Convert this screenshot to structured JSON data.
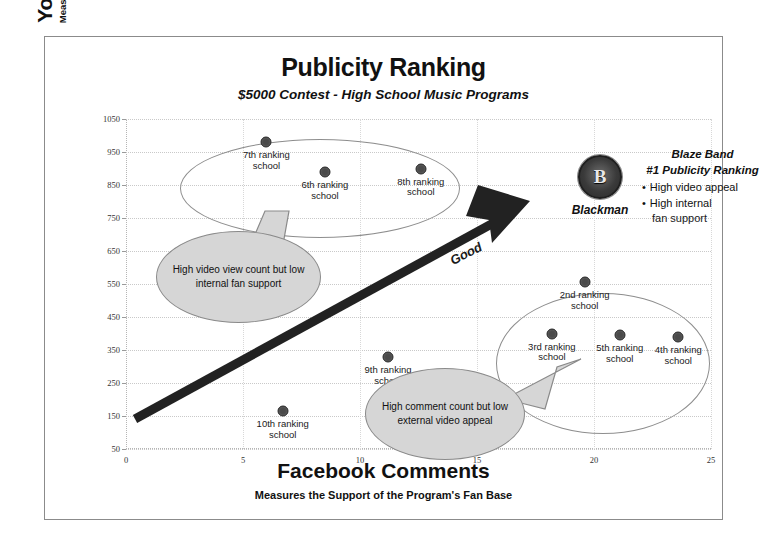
{
  "chart_data": {
    "type": "scatter",
    "title": "Publicity Ranking",
    "subtitle": "$5000 Contest - High School Music Programs",
    "xlabel": "Facebook Comments",
    "xlabel_sub": "Measures the Support of the Program's Fan Base",
    "ylabel": "YouTube Views",
    "ylabel_sub": "Measures the Program's Appeal to Everyone Voting",
    "xlim": [
      0,
      25
    ],
    "ylim": [
      50,
      1050
    ],
    "xticks": [
      0,
      5,
      10,
      15,
      20,
      25
    ],
    "yticks": [
      50,
      150,
      250,
      350,
      450,
      550,
      650,
      750,
      850,
      950,
      1050
    ],
    "grid": true,
    "legend": "none",
    "points": [
      {
        "label": "7th ranking\nschool",
        "label_line1": "7th ranking",
        "label_line2": "school",
        "x": 6.0,
        "y": 980
      },
      {
        "label": "6th ranking\nschool",
        "label_line1": "6th ranking",
        "label_line2": "school",
        "x": 8.5,
        "y": 890
      },
      {
        "label": "8th ranking\nschool",
        "label_line1": "8th ranking",
        "label_line2": "school",
        "x": 12.6,
        "y": 900
      },
      {
        "label": "9th ranking\nschool",
        "label_line1": "9th ranking",
        "label_line2": "school",
        "x": 11.2,
        "y": 330
      },
      {
        "label": "10th ranking\nschool",
        "label_line1": "10th ranking",
        "label_line2": "school",
        "x": 6.7,
        "y": 165
      },
      {
        "label": "2nd ranking\nschool",
        "label_line1": "2nd ranking",
        "label_line2": "school",
        "x": 19.6,
        "y": 555
      },
      {
        "label": "3rd ranking\nschool",
        "label_line1": "3rd ranking",
        "label_line2": "school",
        "x": 18.2,
        "y": 400
      },
      {
        "label": "5th ranking\nschool",
        "label_line1": "5th ranking",
        "label_line2": "school",
        "x": 21.1,
        "y": 395
      },
      {
        "label": "4th ranking\nschool",
        "label_line1": "4th ranking",
        "label_line2": "school",
        "x": 23.6,
        "y": 390
      }
    ],
    "annotations": {
      "arrow_label": "Good",
      "callouts": [
        {
          "id": "low-fan-support",
          "text": "High video view count but low internal fan support",
          "points_to": "top-left cluster"
        },
        {
          "id": "low-video-appeal",
          "text": "High comment count but low external video appeal",
          "points_to": "right cluster"
        }
      ],
      "highlight": {
        "name": "Blackman",
        "line1": "Blaze Band",
        "line2": "#1 Publicity Ranking",
        "bullets": [
          "High video appeal",
          "High internal fan support"
        ],
        "bullet_1": "High video appeal",
        "bullet_2_line1": "High internal",
        "bullet_2_line2": "fan support",
        "logo": "blackman-seal-logo",
        "logo_letter": "B"
      }
    },
    "colors": {
      "point": "#4a4a4a",
      "callout_fill": "#d6d6d6",
      "callout_stroke": "#8a8a8a",
      "arrow": "#222222",
      "grid": "#c9c9c9",
      "border": "#8b8b8b"
    }
  }
}
